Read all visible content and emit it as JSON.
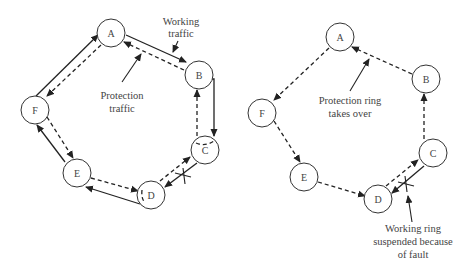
{
  "left_diagram": {
    "title": "Normal operation",
    "nodes": [
      {
        "id": "A",
        "label": "A",
        "x": 111,
        "y": 33
      },
      {
        "id": "B",
        "label": "B",
        "x": 199,
        "y": 75
      },
      {
        "id": "C",
        "label": "C",
        "x": 205,
        "y": 150
      },
      {
        "id": "D",
        "label": "D",
        "x": 151,
        "y": 195
      },
      {
        "id": "E",
        "label": "E",
        "x": 77,
        "y": 173
      },
      {
        "id": "F",
        "label": "F",
        "x": 35,
        "y": 110
      }
    ],
    "annotations": {
      "working_line1": "Working",
      "working_line2": "traffic",
      "protection_line1": "Protection",
      "protection_line2": "traffic"
    },
    "fault_marker": "X"
  },
  "right_diagram": {
    "title": "Fault condition",
    "nodes": [
      {
        "id": "A",
        "label": "A",
        "x": 340,
        "y": 37
      },
      {
        "id": "B",
        "label": "B",
        "x": 426,
        "y": 79
      },
      {
        "id": "C",
        "label": "C",
        "x": 433,
        "y": 153
      },
      {
        "id": "D",
        "label": "D",
        "x": 378,
        "y": 199
      },
      {
        "id": "E",
        "label": "E",
        "x": 304,
        "y": 177
      },
      {
        "id": "F",
        "label": "F",
        "x": 262,
        "y": 113
      }
    ],
    "annotations": {
      "protection_line1": "Protection ring",
      "protection_line2": "takes over",
      "fault_line1": "Working ring",
      "fault_line2": "suspended because",
      "fault_line3": "of fault"
    },
    "fault_marker": "X"
  },
  "edge_legend": {
    "solid": "Working traffic",
    "dashed": "Protection traffic"
  }
}
